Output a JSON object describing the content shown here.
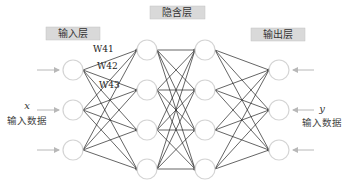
{
  "layers": {
    "input": {
      "label": "输入层",
      "node_count": 3
    },
    "hidden": {
      "label": "隐含层",
      "columns": 2,
      "nodes_per_column": 4
    },
    "output": {
      "label": "输出层",
      "node_count": 3
    }
  },
  "weights": [
    "W41",
    "W42",
    "W43"
  ],
  "input_side": {
    "variable": "x",
    "caption": "输入数据"
  },
  "output_side": {
    "variable": "y",
    "caption": "输入数据"
  },
  "colors": {
    "label_box": "#d9d9d9",
    "label_box_border": "#bcbcbc",
    "node_stroke": "#d4d4d4",
    "edge": "#222222",
    "arrow": "#b8b8b8"
  }
}
